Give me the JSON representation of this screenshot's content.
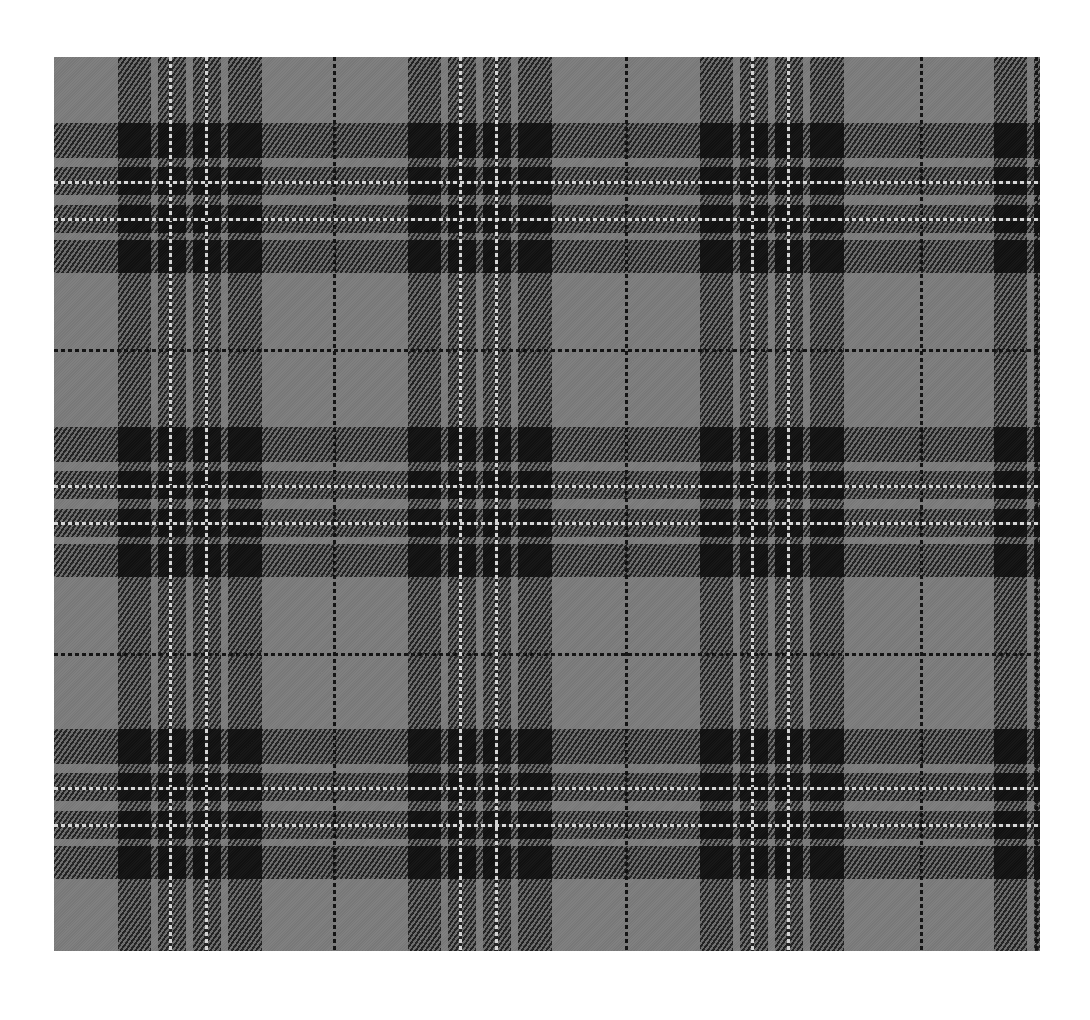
{
  "image": {
    "description": "Grey and black tartan plaid fabric swatch",
    "colors": {
      "ground": "#7c7c7c",
      "dark": "#1a1a1a",
      "intersection": "#111111",
      "white_line": "#d8d8d8"
    },
    "origin": {
      "x": 54,
      "y": 57
    },
    "size": {
      "width": 986,
      "height": 894
    },
    "vertical_blocks_x": [
      118,
      408,
      700,
      994
    ],
    "horizontal_blocks_y": [
      123,
      427,
      729
    ],
    "vertical_thin_lines_x": [
      334,
      626,
      921,
      1036
    ],
    "horizontal_thin_lines_y": [
      350,
      654
    ],
    "block_pattern": [
      {
        "offset": 0,
        "width": 33,
        "type": "dark"
      },
      {
        "offset": 40,
        "width": 28,
        "type": "dark",
        "white_at": 12
      },
      {
        "offset": 75,
        "width": 28,
        "type": "dark",
        "white_at": 13
      },
      {
        "offset": 110,
        "width": 34,
        "type": "dark"
      }
    ],
    "block_pattern_h": [
      {
        "offset": 0,
        "width": 35,
        "type": "dark"
      },
      {
        "offset": 44,
        "width": 28,
        "type": "dark",
        "white_at": 15
      },
      {
        "offset": 82,
        "width": 28,
        "type": "dark",
        "white_at": 14
      },
      {
        "offset": 117,
        "width": 33,
        "type": "dark"
      }
    ]
  }
}
